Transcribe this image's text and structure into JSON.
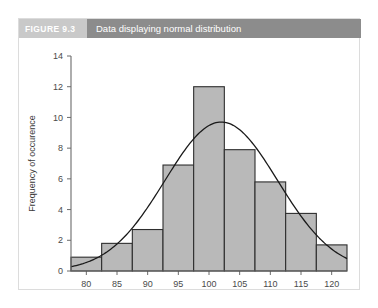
{
  "figure": {
    "number_label": "FIGURE 9.3",
    "title": "Data displaying normal distribution",
    "header_chip_color": "#c9c9c9",
    "header_band_color": "#8c8c8c",
    "border_color": "#dcdcdc"
  },
  "chart_data": {
    "type": "bar",
    "title": "Data displaying normal distribution",
    "xlabel": "IQ",
    "ylabel": "Frequency of occurence",
    "xlim": [
      77.5,
      122.5
    ],
    "ylim": [
      0,
      14
    ],
    "grid": false,
    "legend": null,
    "bar_fill_color": "#b9b9b9",
    "bar_edge_color": "#2e2e2e",
    "curve_color": "#1a1a1a",
    "xticks": [
      80,
      85,
      90,
      95,
      100,
      105,
      110,
      115,
      120
    ],
    "yticks": [
      0,
      2,
      4,
      6,
      8,
      10,
      12,
      14
    ],
    "bin_width": 5,
    "bin_edges": [
      77.5,
      82.5,
      87.5,
      92.5,
      97.5,
      102.5,
      107.5,
      112.5,
      117.5,
      122.5
    ],
    "bin_centers": [
      80,
      85,
      90,
      95,
      100,
      105,
      110,
      115,
      120
    ],
    "values": [
      0.9,
      1.8,
      2.7,
      6.9,
      12,
      7.9,
      5.8,
      3.75,
      1.7
    ],
    "overlay_curve": {
      "name": "normal distribution curve",
      "peak_x": 102,
      "peak_y": 9.7,
      "mean": 102,
      "std_dev": 9.2,
      "amplitude": 9.7
    }
  }
}
